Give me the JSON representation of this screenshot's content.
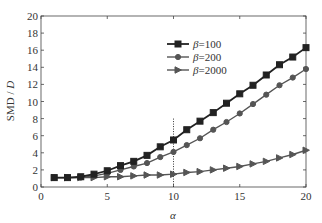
{
  "chart_data": {
    "type": "line",
    "title": "",
    "xlabel": "α",
    "ylabel": "SMD / D",
    "xlim": [
      0,
      20
    ],
    "ylim": [
      0,
      20
    ],
    "xticks": [
      0,
      5,
      10,
      15,
      20
    ],
    "yticks": [
      0,
      2,
      4,
      6,
      8,
      10,
      12,
      14,
      16,
      18,
      20
    ],
    "grid": false,
    "legend_position": "upper center",
    "x": [
      1,
      2,
      3,
      4,
      5,
      6,
      7,
      8,
      9,
      10,
      11,
      12,
      13,
      14,
      15,
      16,
      17,
      18,
      19,
      20
    ],
    "series": [
      {
        "name": "β=100",
        "marker": "square",
        "color": "#222222",
        "values": [
          1.1,
          1.1,
          1.2,
          1.5,
          1.9,
          2.5,
          3.0,
          3.7,
          4.7,
          5.5,
          6.7,
          7.7,
          8.7,
          9.8,
          10.9,
          11.9,
          13.1,
          14.3,
          15.2,
          16.3
        ]
      },
      {
        "name": "β=200",
        "marker": "circle",
        "color": "#555555",
        "values": [
          1.1,
          1.1,
          1.1,
          1.3,
          1.6,
          2.0,
          2.4,
          2.8,
          3.5,
          4.1,
          4.9,
          5.7,
          6.7,
          7.6,
          8.6,
          9.7,
          10.8,
          11.9,
          12.8,
          13.8
        ]
      },
      {
        "name": "β=2000",
        "marker": "triangle-right",
        "color": "#555555",
        "values": [
          1.1,
          1.1,
          1.1,
          1.1,
          1.2,
          1.2,
          1.3,
          1.4,
          1.4,
          1.5,
          1.7,
          1.8,
          2.0,
          2.2,
          2.4,
          2.7,
          3.0,
          3.4,
          3.8,
          4.3
        ]
      }
    ],
    "annotations": [
      {
        "type": "vertical-dotted-line",
        "x": 10,
        "y_from": 0,
        "y_to": 8
      }
    ]
  },
  "legend": {
    "items": [
      {
        "label": "β=100"
      },
      {
        "label": "β=200"
      },
      {
        "label": "β=2000"
      }
    ]
  },
  "axes": {
    "xlabel": "α",
    "ylabel_main": "SMD / ",
    "ylabel_italic": "D"
  }
}
